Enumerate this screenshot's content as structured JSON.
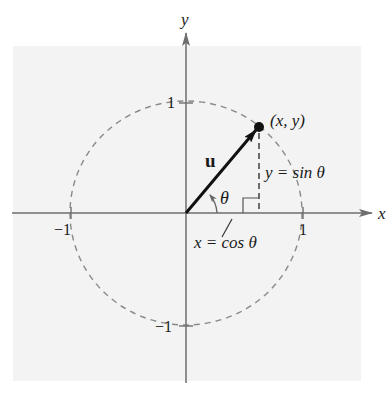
{
  "figure": {
    "background_color": "#f3f3f3",
    "axis_color": "#6e6e6e",
    "circle_color": "#8a8a8a",
    "vector_color": "#111111",
    "text_color": "#1a1a1a"
  },
  "axes": {
    "x_label": "x",
    "y_label": "y",
    "x_ticks": [
      {
        "value": -1,
        "label": "−1"
      },
      {
        "value": 1,
        "label": "1"
      }
    ],
    "y_ticks": [
      {
        "value": 1,
        "label": "1"
      },
      {
        "value": -1,
        "label": "−1"
      }
    ]
  },
  "unit_circle": {
    "style": "dashed",
    "radius": 1
  },
  "vector": {
    "label": "u",
    "from": [
      0,
      0
    ],
    "to_point_label": "(x, y)"
  },
  "angle": {
    "label": "θ"
  },
  "annotations": {
    "vertical_component": "y = sin θ",
    "horizontal_component": "x = cos θ"
  }
}
